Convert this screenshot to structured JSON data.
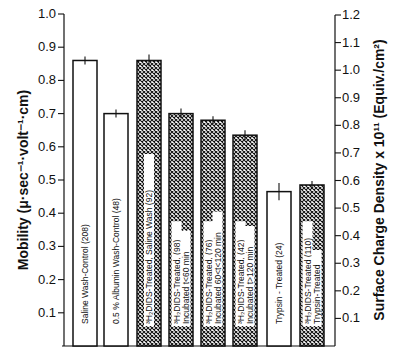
{
  "chart_data": {
    "type": "bar",
    "title": "",
    "xlabel": "",
    "ylabel": "Mobility (μ·sec⁻¹·volt⁻¹·cm)",
    "ylabel_right": "Surface Charge Density x 10¹¹ (Equiv./cm²)",
    "ylim": [
      0,
      1.0
    ],
    "ylim_right": [
      0,
      1.2
    ],
    "yticks": [
      "0.1",
      "0.2",
      "0.3",
      "0.4",
      "0.5",
      "0.6",
      "0.7",
      "0.8",
      "0.9",
      "1.0"
    ],
    "yticks_right": [
      "0.1",
      "0.2",
      "0.3",
      "0.4",
      "0.5",
      "0.6",
      "0.7",
      "0.8",
      "0.9",
      "1.0",
      "1.1",
      "1.2"
    ],
    "grid": false,
    "categories": [
      "Saline Wash-Control (208)",
      "0.5 % Albumin Wash-Control (48)",
      "³H₂DIDS-Treated, Saline Wash (92)",
      "³H₂DIDS-Treated, (98) Incubated t<60 min",
      "³H₂DIDS-Treated, (76) Incubated 60<t<120 min",
      "³H₂DIDS-Treated, (42) Incubated t>120 min",
      "Trypsin-Treated (24)",
      "³H₂DIDS-Treated Trypsin-Treated (110)"
    ],
    "values": [
      0.86,
      0.7,
      0.86,
      0.7,
      0.68,
      0.635,
      0.465,
      0.485
    ],
    "errors": [
      0.006,
      0.006,
      0.012,
      0.009,
      0.006,
      0.009,
      0.02,
      0.006
    ],
    "patterns": [
      "open",
      "open",
      "hatched",
      "hatched",
      "hatched",
      "hatched",
      "open",
      "hatched"
    ],
    "bar_labels": [
      [
        "Saline  Wash-Control (208)"
      ],
      [
        "0.5 %  Albumin  Wash-Control (48)"
      ],
      [
        "³H₂DIDS-Treated,  Saline  Wash (92)"
      ],
      [
        "³H₂DIDS-Treated, (98)",
        "Incubated  t<60 min"
      ],
      [
        "³H₂DIDS-Treated, (76)",
        "Incubated  60<t<120 min"
      ],
      [
        "³H₂DIDS-Treated, (42)",
        "Incubated  t>120 min"
      ],
      [
        "Trypsin - Treated (24)"
      ],
      [
        "³H₂DIDS-Treated (110)",
        "Trypsin-Treated"
      ]
    ]
  }
}
